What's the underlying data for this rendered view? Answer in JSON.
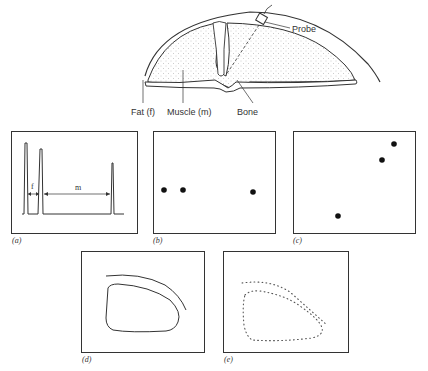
{
  "figure": {
    "anatomy": {
      "labels": {
        "probe": "Probe",
        "fat": "Fat (f)",
        "muscle": "Muscle (m)",
        "bone": "Bone"
      }
    },
    "panels": [
      {
        "id": "a",
        "label": "(a)",
        "kind": "A-scan trace",
        "annotations": {
          "fat_span": "f",
          "muscle_span": "m"
        }
      },
      {
        "id": "b",
        "label": "(b)",
        "kind": "dot display",
        "dots": 3
      },
      {
        "id": "c",
        "label": "(c)",
        "kind": "dot display",
        "dots": 3
      },
      {
        "id": "d",
        "label": "(d)",
        "kind": "solid outline of fat and muscle boundary"
      },
      {
        "id": "e",
        "label": "(e)",
        "kind": "dotted outline of fat and muscle boundary"
      }
    ]
  },
  "colors": {
    "line": "#333333",
    "stipple": "#9a9a9a",
    "background": "#ffffff"
  }
}
